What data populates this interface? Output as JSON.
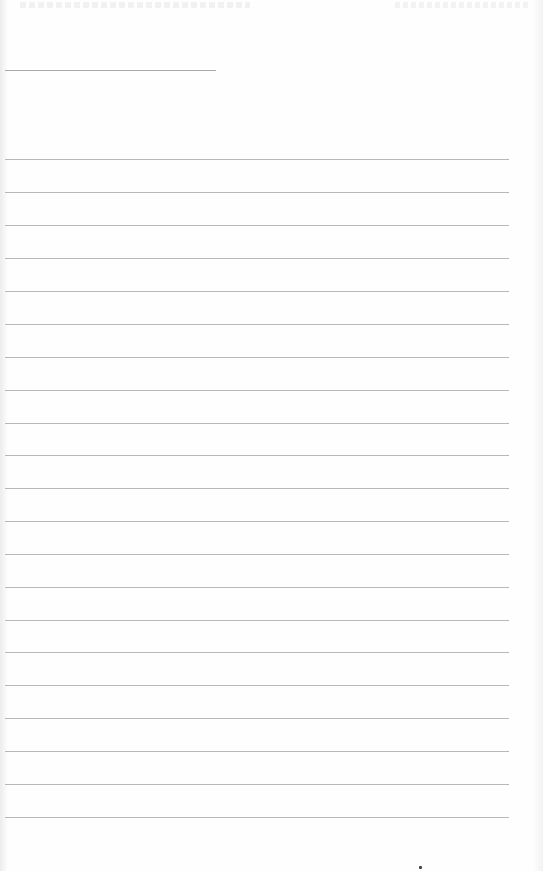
{
  "document": {
    "type": "blank ruled notebook page",
    "background_color": "#fefefe",
    "line_color": "#b8b8b8",
    "header_line": {
      "x": 5,
      "y": 70,
      "width": 211
    },
    "ruled_lines": {
      "count": 21,
      "x": 5,
      "width": 504,
      "y_positions": [
        159,
        192,
        225,
        258,
        291,
        324,
        357,
        390,
        423,
        455,
        488,
        521,
        554,
        587,
        620,
        652,
        685,
        718,
        751,
        784,
        817
      ]
    },
    "mark": {
      "x": 420,
      "y": 867
    }
  }
}
